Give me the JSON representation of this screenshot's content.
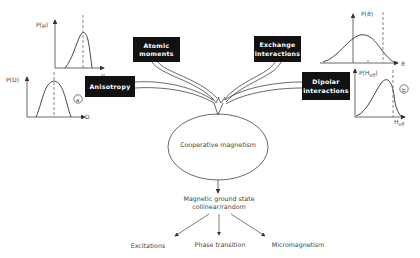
{
  "diagram": {
    "boxes": {
      "atomic_moments": [
        "Atomic",
        "moments"
      ],
      "anisotropy": [
        "Anisotropy"
      ],
      "exchange_interactions": [
        "Exchange",
        "interactions"
      ],
      "dipolar_interactions": [
        "Dipolar",
        "interactions"
      ]
    },
    "center": "Cooperative magnetism",
    "ground_state": [
      "Magnetic ground state",
      "collinear/random"
    ],
    "outcomes": [
      "Excitations",
      "Phase transition",
      "Micromagnetism"
    ],
    "plots": {
      "p_mu": {
        "ylabel": "P(μ)",
        "xlabel": "μ"
      },
      "p_d": {
        "ylabel": "P(D)",
        "xlabel": "D",
        "marker": "a"
      },
      "p_theta": {
        "ylabel": "P(ϑ)",
        "xlabel": "ϑ"
      },
      "p_heff": {
        "ylabel": "P(H",
        "ylabel_sub": "eff",
        "ylabel_end": ")",
        "xlabel": "H",
        "xlabel_sub": "eff",
        "marker": "b"
      }
    }
  }
}
